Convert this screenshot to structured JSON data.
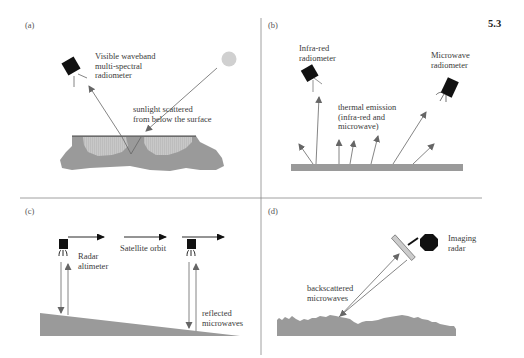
{
  "figure": {
    "section_number": "5.3",
    "colors": {
      "surface_gray": "#9a9a9a",
      "light_fill": "#c4c4c4",
      "instrument": "#111111",
      "arrow": "#666666",
      "sun": "#d0d0d0",
      "divider": "#888888"
    },
    "panels": [
      {
        "id": "a",
        "label": "(a)",
        "instrument": "Visible waveband multi-spectral radiometer",
        "instrument_lines": [
          "Visible waveband",
          "multi-spectral",
          "radiometer"
        ],
        "annotation_lines": [
          "sunlight scattered",
          "from below the surface"
        ]
      },
      {
        "id": "b",
        "label": "(b)",
        "instrument_left_lines": [
          "Infra-red",
          "radiometer"
        ],
        "instrument_right_lines": [
          "Microwave",
          "radiometer"
        ],
        "annotation_lines": [
          "thermal emission",
          "(infra-red and",
          "microwave)"
        ]
      },
      {
        "id": "c",
        "label": "(c)",
        "orbit_label": "Satellite orbit",
        "instrument_lines": [
          "Radar",
          "altimeter"
        ],
        "annotation_lines": [
          "reflected",
          "microwaves"
        ]
      },
      {
        "id": "d",
        "label": "(d)",
        "instrument_lines": [
          "Imaging",
          "radar"
        ],
        "annotation_lines": [
          "backscattered",
          "microwaves"
        ]
      }
    ]
  }
}
